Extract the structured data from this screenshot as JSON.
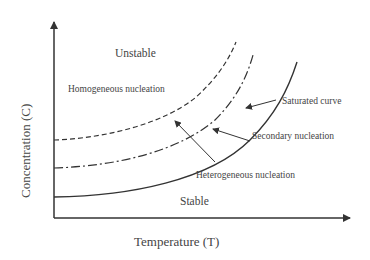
{
  "diagram": {
    "title": "",
    "axes": {
      "x_label": "Temperature  (T)",
      "y_label": "Concentration (C)"
    },
    "regions": {
      "upper": "Unstable",
      "lower": "Stable"
    },
    "annotations": {
      "homogeneous": "Homogeneous nucleation",
      "saturated": "Saturated curve",
      "secondary": "Secondary nucleation",
      "heterogeneous": "Heterogeneous nucleation"
    },
    "curves": [
      {
        "name": "Saturated curve",
        "style": "solid"
      },
      {
        "name": "Secondary nucleation limit",
        "style": "dash-dot"
      },
      {
        "name": "Homogeneous nucleation limit",
        "style": "dashed"
      }
    ],
    "colors": {
      "line": "#333333",
      "text": "#444444",
      "background": "#ffffff"
    }
  }
}
